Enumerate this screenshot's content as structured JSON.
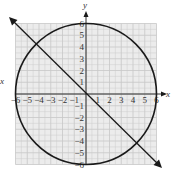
{
  "chart_data": {
    "type": "line",
    "title": "",
    "xlabel": "x",
    "ylabel": "y",
    "xlim": [
      -6,
      6
    ],
    "ylim": [
      -6,
      6
    ],
    "grid": true,
    "x_ticks": [
      "-6",
      "-5",
      "-4",
      "-3",
      "-2",
      "-1",
      "1",
      "2",
      "3",
      "4",
      "5",
      "6"
    ],
    "y_ticks": [
      "6",
      "5",
      "4",
      "3",
      "2",
      "1",
      "-1",
      "-2",
      "-3",
      "-4",
      "-5",
      "-6"
    ],
    "series": [
      {
        "name": "circle",
        "equation": "x^2 + y^2 = 36",
        "center": [
          0,
          0
        ],
        "radius": 6
      },
      {
        "name": "line",
        "equation": "y = -x",
        "points": [
          [
            -6.5,
            6.5
          ],
          [
            6.5,
            -6.5
          ]
        ],
        "arrows": "both"
      }
    ],
    "intersections": [
      [
        -4.24,
        4.24
      ],
      [
        4.24,
        -4.24
      ]
    ],
    "shaded_region": "grid area (light gray) inside square [-6,6]x[-6,6]"
  },
  "labels": {
    "x_axis": "x",
    "y_axis": "y",
    "x_left": "x"
  },
  "colors": {
    "grid_bg": "#ececec",
    "grid_line": "#c8c8c8",
    "stroke": "#1a1a1a"
  }
}
